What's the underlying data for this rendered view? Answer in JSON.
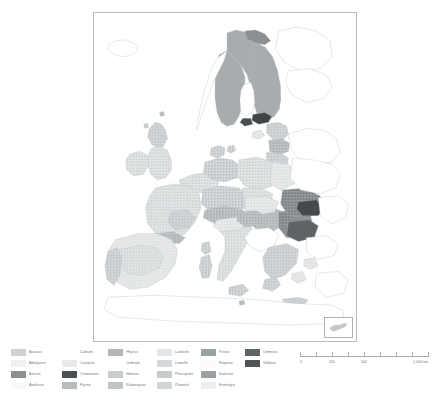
{
  "figure": {
    "kind": "choropleth-map",
    "region": "Europe",
    "frame_color": "#b9bcbe",
    "background": "#ffffff"
  },
  "map": {
    "inset": {
      "name": "cyprus-inset",
      "label": ""
    },
    "ocean_color": "#ffffff",
    "border_color": "#bcbfc1",
    "fill_colors": [
      "#d9dcdd",
      "#eceeef",
      "#8f9396",
      "#f6f7f7",
      "#cfd2d4",
      "#e4e6e7",
      "#b5b9bb",
      "#a4a8ab",
      "#c3c6c8",
      "#6e7275",
      "#3f4447",
      "#555a5d"
    ]
  },
  "legend": {
    "columns": [
      {
        "items": [
          {
            "label": "Aurarus",
            "color": "#cdd1d3"
          },
          {
            "label": "Abalyarois",
            "color": "#eff1f1"
          },
          {
            "label": "Aetirus",
            "color": "#8b8f92"
          },
          {
            "label": "Awrlacos",
            "color": "#f8f9f9"
          }
        ]
      },
      {
        "items": [
          {
            "label": "Cabrum",
            "color": "#ffffff"
          },
          {
            "label": "Carlipuls",
            "color": "#e8eaeb"
          },
          {
            "label": "Chamosets",
            "color": "#4b5053"
          },
          {
            "label": "Flyrent",
            "color": "#b8bcbe"
          }
        ]
      },
      {
        "items": [
          {
            "label": "Hnyrus",
            "color": "#b2b6b9"
          },
          {
            "label": "Ordinals",
            "color": "#ffffff"
          },
          {
            "label": "Hohous",
            "color": "#c9cdcf"
          },
          {
            "label": "Kabanuyros",
            "color": "#c1c5c7"
          }
        ]
      },
      {
        "items": [
          {
            "label": "Larkords",
            "color": "#e4e6e7"
          },
          {
            "label": "Lumulls",
            "color": "#d5d8da"
          },
          {
            "label": "Phasupims",
            "color": "#c7cbcd"
          },
          {
            "label": "Planouls",
            "color": "#d2d5d7"
          }
        ]
      },
      {
        "items": [
          {
            "label": "Protus",
            "color": "#9ba0a3"
          },
          {
            "label": "Flojosus",
            "color": "#fafbfb"
          },
          {
            "label": "Sufectas",
            "color": "#9aa0a3"
          },
          {
            "label": "Enmelgus",
            "color": "#eceeef"
          }
        ]
      },
      {
        "items": [
          {
            "label": "Ummess",
            "color": "#5f6467"
          },
          {
            "label": "Velbous",
            "color": "#4e5457"
          }
        ]
      }
    ]
  },
  "scale_bar": {
    "unit": "km",
    "ticks": [
      0,
      125,
      250,
      375,
      500,
      625,
      750,
      875,
      1000
    ],
    "labels": [
      {
        "value": 0,
        "text": "0"
      },
      {
        "value": 250,
        "text": "250"
      },
      {
        "value": 500,
        "text": "500"
      },
      {
        "value": 1000,
        "text": "1,000 km"
      }
    ]
  }
}
